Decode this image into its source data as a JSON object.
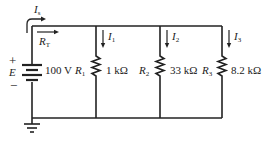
{
  "diagram": {
    "type": "parallel-circuit",
    "source": {
      "name": "E",
      "value": "100 V",
      "plus": "+",
      "minus": "−"
    },
    "source_current": {
      "symbol": "I",
      "subscript": "s"
    },
    "total_resistance": {
      "symbol": "R",
      "subscript": "T"
    },
    "branches": [
      {
        "resistor": "R",
        "resistor_sub": "1",
        "value": "1 kΩ",
        "current": "I",
        "current_sub": "1"
      },
      {
        "resistor": "R",
        "resistor_sub": "2",
        "value": "33 kΩ",
        "current": "I",
        "current_sub": "2"
      },
      {
        "resistor": "R",
        "resistor_sub": "3",
        "value": "8.2 kΩ",
        "current": "I",
        "current_sub": "3"
      }
    ],
    "ground": "ground-symbol",
    "colors": {
      "wire": "#222222",
      "background": "#ffffff"
    }
  }
}
